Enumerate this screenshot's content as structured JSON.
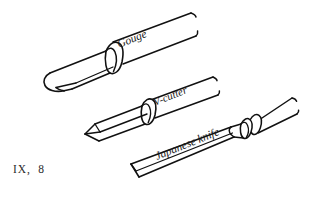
{
  "figure": {
    "caption": "IX,  8",
    "background_color": "#ffffff",
    "line_color": "#111111",
    "label_color": "#1a1a1a",
    "tools": [
      {
        "id": "gouge",
        "label": "Gouge",
        "label_rotation_deg": -22,
        "description": "hollow U-channel carving gouge with tapered blade and long handle",
        "blade_type": "u-channel"
      },
      {
        "id": "v-cutter",
        "label": "V-cutter",
        "label_rotation_deg": -22,
        "description": "V-groove parting tool with ferrule and long handle",
        "blade_type": "v-groove"
      },
      {
        "id": "japanese-knife",
        "label": "Japanese knife",
        "label_rotation_deg": -22,
        "description": "flat angled skew blade with double ferrule and tapered handle",
        "blade_type": "flat-skew"
      }
    ]
  }
}
